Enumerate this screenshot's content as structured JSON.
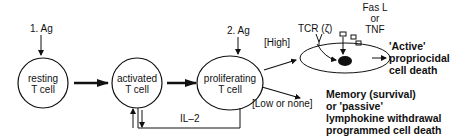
{
  "stimuli": {
    "first": "1. Ag",
    "second": "2. Ag"
  },
  "cells": {
    "resting": {
      "line1": "resting",
      "line2": "T cell"
    },
    "activated": {
      "line1": "activated",
      "line2": "T cell"
    },
    "proliferating": {
      "line1": "proliferating",
      "line2": "T cell"
    }
  },
  "feedback": {
    "label": "IL–2"
  },
  "branches": {
    "high": "[High]",
    "low": "[Low or none]"
  },
  "receptor": {
    "tcr": "TCR (ζ)",
    "ligand_line1": "Fas L",
    "ligand_line2": "or",
    "ligand_line3": "TNF"
  },
  "outcomes": {
    "active": {
      "line1": "'Active'",
      "line2": "propriocidal",
      "line3": "cell death"
    },
    "passive": {
      "line1": "Memory (survival)",
      "line2": "or 'passive'",
      "line3": "lymphokine withdrawal",
      "line4": "programmed cell death"
    }
  }
}
